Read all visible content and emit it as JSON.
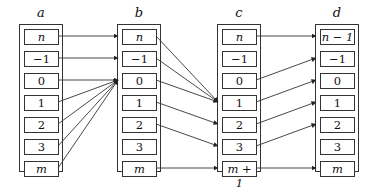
{
  "columns": [
    {
      "label": "a",
      "x": 19,
      "cells": [
        "n",
        "−1",
        "0",
        "1",
        "2",
        "3",
        "m"
      ],
      "italic": [
        true,
        false,
        false,
        false,
        false,
        false,
        true
      ]
    },
    {
      "label": "b",
      "x": 117,
      "cells": [
        "n",
        "−1",
        "0",
        "1",
        "2",
        "3",
        "m"
      ],
      "italic": [
        true,
        false,
        false,
        false,
        false,
        false,
        true
      ]
    },
    {
      "label": "c",
      "x": 217,
      "cells": [
        "n",
        "−1",
        "0",
        "1",
        "2",
        "3",
        "m + 1"
      ],
      "italic": [
        true,
        false,
        false,
        false,
        false,
        false,
        true
      ]
    },
    {
      "label": "d",
      "x": 315,
      "cells": [
        "n − 1",
        "−1",
        "0",
        "1",
        "2",
        "3",
        "m"
      ],
      "italic": [
        true,
        false,
        false,
        false,
        false,
        false,
        true
      ]
    }
  ],
  "arrows": [
    {
      "from": [
        "a",
        0
      ],
      "to": [
        "b",
        0
      ]
    },
    {
      "from": [
        "a",
        1
      ],
      "to": [
        "b",
        1
      ]
    },
    {
      "from": [
        "a",
        2
      ],
      "to": [
        "b",
        2
      ]
    },
    {
      "from": [
        "a",
        3
      ],
      "to": [
        "b",
        2
      ]
    },
    {
      "from": [
        "a",
        4
      ],
      "to": [
        "b",
        2
      ]
    },
    {
      "from": [
        "a",
        5
      ],
      "to": [
        "b",
        2
      ]
    },
    {
      "from": [
        "a",
        6
      ],
      "to": [
        "b",
        2
      ]
    },
    {
      "from": [
        "b",
        0
      ],
      "to": [
        "c",
        3
      ]
    },
    {
      "from": [
        "b",
        1
      ],
      "to": [
        "c",
        3
      ]
    },
    {
      "from": [
        "b",
        2
      ],
      "to": [
        "c",
        3
      ]
    },
    {
      "from": [
        "b",
        3
      ],
      "to": [
        "c",
        4
      ]
    },
    {
      "from": [
        "b",
        4
      ],
      "to": [
        "c",
        5
      ]
    },
    {
      "from": [
        "b",
        6
      ],
      "to": [
        "c",
        6
      ]
    },
    {
      "from": [
        "c",
        0
      ],
      "to": [
        "d",
        0
      ]
    },
    {
      "from": [
        "c",
        2
      ],
      "to": [
        "d",
        1
      ]
    },
    {
      "from": [
        "c",
        3
      ],
      "to": [
        "d",
        2
      ]
    },
    {
      "from": [
        "c",
        4
      ],
      "to": [
        "d",
        3
      ]
    },
    {
      "from": [
        "c",
        5
      ],
      "to": [
        "d",
        4
      ]
    },
    {
      "from": [
        "c",
        6
      ],
      "to": [
        "d",
        6
      ]
    }
  ]
}
